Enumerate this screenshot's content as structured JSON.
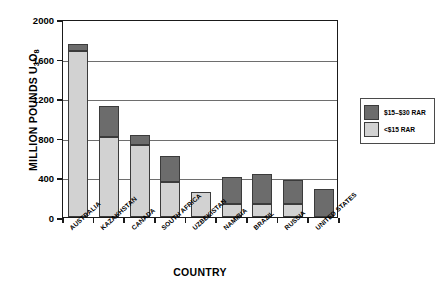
{
  "chart_data": {
    "type": "bar",
    "subtype": "stacked-vertical",
    "title": "",
    "xlabel": "COUNTRY",
    "ylabel": "MILLION POUNDS U3O8",
    "ylabel_parts": {
      "prefix": "MILLION POUNDS U",
      "sub1": "3",
      "mid": "O",
      "sub2": "8"
    },
    "ylim": [
      0,
      2000
    ],
    "yticks": [
      0,
      400,
      800,
      1200,
      1600,
      2000
    ],
    "ytick_labels": [
      "0",
      "400",
      "800",
      "1200",
      "1600",
      "2000"
    ],
    "grid": true,
    "grid_axis": "y",
    "legend_position": "right",
    "categories": [
      "AUSTRALIA",
      "KAZAKHSTAN",
      "CANADA",
      "SOUTH AFRICA",
      "UZBEKISTAN",
      "NAMIBIA",
      "BRAZIL",
      "RUSSIA",
      "UNITED STATES"
    ],
    "series": [
      {
        "name": "<$15 RAR",
        "color": "#d2d2d2",
        "values": [
          1680,
          810,
          730,
          355,
          250,
          130,
          130,
          130,
          0
        ]
      },
      {
        "name": "$15-$30 RAR",
        "color": "#6c6c6c",
        "values": [
          70,
          310,
          100,
          260,
          0,
          270,
          305,
          245,
          280
        ]
      }
    ],
    "totals": [
      1750,
      1120,
      830,
      615,
      250,
      400,
      435,
      375,
      280
    ]
  },
  "legend": {
    "items": [
      {
        "label": "$15–$30 RAR",
        "color": "#6c6c6c"
      },
      {
        "label": "<$15 RAR",
        "color": "#d2d2d2"
      }
    ]
  },
  "colors": {
    "high_cost": "#6c6c6c",
    "low_cost": "#d2d2d2",
    "axis": "#1a1a1a",
    "grid": "#6e6e6e",
    "background": "#ffffff"
  }
}
